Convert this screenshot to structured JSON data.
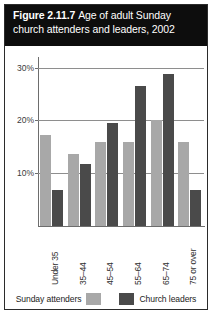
{
  "figure": {
    "number": "Figure 2.11.7",
    "caption_line1": "Age of adult Sunday",
    "caption_line2": "church attenders and leaders, 2002",
    "title_full": "Figure 2.11.7 Age of adult Sunday church attenders and leaders, 2002"
  },
  "legend": {
    "position": "bottom-center",
    "entries": [
      {
        "label": "Sunday attenders",
        "color": "#a8a8a8"
      },
      {
        "label": "Church leaders",
        "color": "#4a4a4a"
      }
    ]
  },
  "axis": {
    "y_ticks": [
      {
        "label": "10%",
        "value": 10
      },
      {
        "label": "20%",
        "value": 20
      },
      {
        "label": "30%",
        "value": 30
      }
    ]
  },
  "chart_data": {
    "type": "bar",
    "subtitle": "",
    "xlabel": "",
    "ylabel": "",
    "categories": [
      "Under 35",
      "35–44",
      "45–54",
      "55–64",
      "65–74",
      "75 or over"
    ],
    "series": [
      {
        "name": "Sunday attenders",
        "color": "#a8a8a8",
        "values": [
          17.3,
          13.6,
          16.0,
          16.0,
          20.0,
          16.0
        ]
      },
      {
        "name": "Church leaders",
        "color": "#4a4a4a",
        "values": [
          6.9,
          11.8,
          19.5,
          26.5,
          28.8,
          6.8
        ]
      }
    ],
    "ylim": [
      0,
      32
    ],
    "yticks": [
      10,
      20,
      30
    ],
    "ytick_labels": [
      "10%",
      "20%",
      "30%"
    ],
    "grid": true,
    "legend_position": "bottom"
  },
  "colors": {
    "attenders": "#a8a8a8",
    "leaders": "#4a4a4a",
    "title_band": "#0d0d0d",
    "title_text": "#ffffff",
    "grid": "#8e8e8e",
    "axis": "#6d6d6d",
    "frame": "#2b2b2b"
  }
}
